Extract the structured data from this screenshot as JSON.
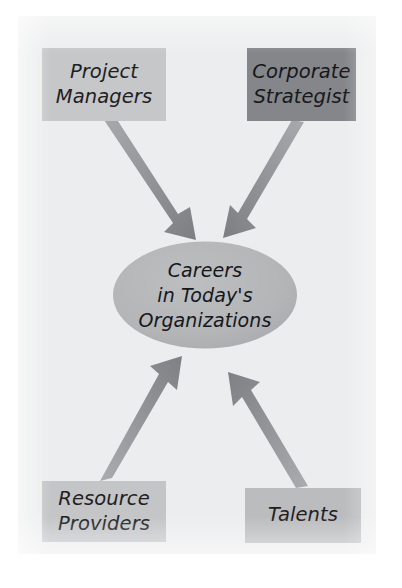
{
  "figure": {
    "kind": "influence-diagram",
    "background_color": "#ffffff",
    "panel_color": "#ecedee"
  },
  "hub": {
    "label": "Careers\nin Today's\nOrganizations",
    "shape": "ellipse",
    "fill": "#b3b5b7"
  },
  "nodes": [
    {
      "id": "project-managers",
      "label": "Project\nManagers",
      "fill": "#c6c7c9",
      "position": "top-left"
    },
    {
      "id": "corporate-strategist",
      "label": "Corporate\nStrategist",
      "fill": "#84868a",
      "position": "top-right"
    },
    {
      "id": "resource-providers",
      "label": "Resource\nProviders",
      "fill": "#c3c5c7",
      "position": "bottom-left"
    },
    {
      "id": "talents",
      "label": "Talents",
      "fill": "#babcbe",
      "position": "bottom-right"
    }
  ],
  "arrows": [
    {
      "id": "arrow-project-managers-to-hub",
      "from": "project-managers",
      "to": "hub",
      "direction": "down-right",
      "fill": "#8e9093"
    },
    {
      "id": "arrow-corporate-strategist-to-hub",
      "from": "corporate-strategist",
      "to": "hub",
      "direction": "down-left",
      "fill": "#8e9093"
    },
    {
      "id": "arrow-resource-providers-to-hub",
      "from": "resource-providers",
      "to": "hub",
      "direction": "up-right",
      "fill": "#8e9093"
    },
    {
      "id": "arrow-talents-to-hub",
      "from": "talents",
      "to": "hub",
      "direction": "up-left",
      "fill": "#8e9093"
    }
  ]
}
